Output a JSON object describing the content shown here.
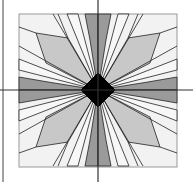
{
  "figure": {
    "type": "quilt-block-star-pattern",
    "colors": {
      "background": "#ffffff",
      "square_fill": "#f2f2f2",
      "light_gray": "#c8c8c8",
      "dark_gray": "#9a9a9a",
      "center": "#000000",
      "outline": "#222222",
      "axis": "#333333"
    },
    "elements": {
      "center_shape": "diamond",
      "petals_dark": 4,
      "kites_light": 4,
      "axes": [
        "horizontal",
        "vertical"
      ]
    }
  }
}
